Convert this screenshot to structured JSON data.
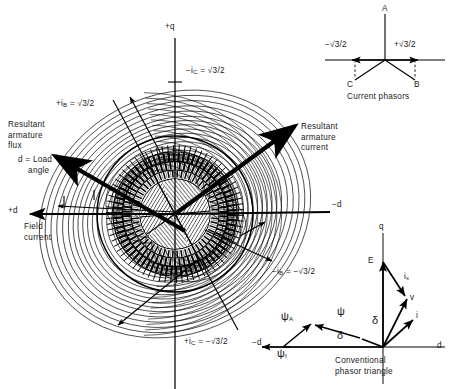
{
  "figure": {
    "background": "#ffffff",
    "ink": "#000000"
  },
  "machine": {
    "axes": {
      "q_positive": "+q",
      "d_positive": "+d",
      "d_negative": "−d",
      "q_negative": ""
    },
    "labels": {
      "ic_neg": "−i",
      "ic_neg_sub": "C",
      "ic_neg_val": " = √3/2",
      "ib_pos": "+i",
      "ib_pos_sub": "B",
      "ib_pos_val": " = √3/2",
      "ic_pos": "+i",
      "ic_pos_sub": "C",
      "ic_pos_val": " = −√3/2",
      "ib_neg": "−i",
      "ib_neg_sub": "B",
      "ib_neg_val": " = −√3/2",
      "resultant_flux": "Resultant\narmature\nflux",
      "load_angle": "d = Load\n    angle",
      "field_current": "Field\ncurrent",
      "resultant_current": "Resultant\narmature\ncurrent"
    }
  },
  "current_phasors": {
    "caption": "Current phasors",
    "phasor_a": "A",
    "phasor_b": "B",
    "phasor_c": "C",
    "value_pos": "+√3/2",
    "value_neg": "−√3/2"
  },
  "phasor_triangle": {
    "caption": "Conventional\nphasor triangle",
    "axis_q": "q",
    "axis_d": "d",
    "axis_d_neg": "−d",
    "emf": "E",
    "reactance_drop": "i",
    "reactance_drop_sub": "x",
    "voltage": "v",
    "current": "i",
    "delta_voltage": "δ",
    "delta_flux": "δ",
    "flux_resultant": "ψ",
    "flux_armature": "ψ",
    "flux_armature_sub": "A",
    "flux_field": "ψ",
    "flux_field_sub": "f"
  }
}
